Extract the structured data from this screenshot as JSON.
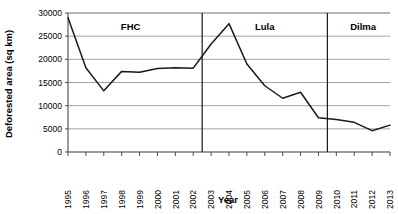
{
  "chart_data": {
    "type": "line",
    "title": "",
    "xlabel": "Year",
    "ylabel": "Deforested area (sq km)",
    "x": [
      1995,
      1996,
      1997,
      1998,
      1999,
      2000,
      2001,
      2002,
      2003,
      2004,
      2005,
      2006,
      2007,
      2008,
      2009,
      2010,
      2011,
      2012,
      2013
    ],
    "categories": [
      "1995",
      "1996",
      "1997",
      "1998",
      "1999",
      "2000",
      "2001",
      "2002",
      "2003",
      "2004",
      "2005",
      "2006",
      "2007",
      "2008",
      "2009",
      "2010",
      "2011",
      "2012",
      "2013"
    ],
    "values": [
      29000,
      18200,
      13200,
      17400,
      17200,
      18000,
      18200,
      18100,
      23300,
      27700,
      19000,
      14300,
      11600,
      12900,
      7400,
      7000,
      6400,
      4600,
      5800
    ],
    "series": [
      {
        "name": "Deforested area",
        "values": [
          29000,
          18200,
          13200,
          17400,
          17200,
          18000,
          18200,
          18100,
          23300,
          27700,
          19000,
          14300,
          11600,
          12900,
          7400,
          7000,
          6400,
          4600,
          5800
        ],
        "color": "#1a1a1a"
      }
    ],
    "ylim": [
      0,
      30000
    ],
    "yticks": [
      0,
      5000,
      10000,
      15000,
      20000,
      25000,
      30000
    ],
    "ytick_labels": [
      "0",
      "5000",
      "10000",
      "15000",
      "20000",
      "25000",
      "30000"
    ],
    "grid": true,
    "legend": "none",
    "annotations": [
      {
        "label": "FHC",
        "start_year": 1995,
        "end_year": 2002
      },
      {
        "label": "Lula",
        "start_year": 2003,
        "end_year": 2009
      },
      {
        "label": "Dilma",
        "start_year": 2010,
        "end_year": 2013
      }
    ],
    "dividers": [
      2002.5,
      2009.5
    ],
    "colors": {
      "line": "#1a1a1a",
      "grid": "#8c8c8c",
      "frame": "#3a3a3a",
      "divider": "#1a1a1a",
      "background": "#ffffff"
    }
  }
}
